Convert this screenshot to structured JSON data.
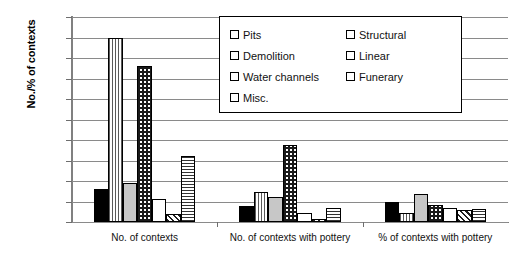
{
  "chart_data": {
    "type": "bar",
    "title": "",
    "xlabel": "",
    "ylabel": "No./% of contexts",
    "ylim": [
      0,
      500
    ],
    "ytick_step": 50,
    "yticks": [
      "500",
      "450",
      "400",
      "350",
      "300",
      "250",
      "200",
      "150",
      "100",
      "50",
      "0"
    ],
    "grid": true,
    "legend_position": "top-right-inset",
    "categories": [
      "No. of contexts",
      "No. of contexts with pottery",
      "% of contexts with pottery"
    ],
    "series": [
      {
        "name": "Pits",
        "pattern": "solid-black",
        "values": [
          80,
          40,
          48
        ]
      },
      {
        "name": "Structural",
        "pattern": "vertical-lines",
        "values": [
          450,
          72,
          22
        ]
      },
      {
        "name": "Demolition",
        "pattern": "solid-gray",
        "values": [
          95,
          62,
          68
        ]
      },
      {
        "name": "Linear",
        "pattern": "checkerboard",
        "values": [
          380,
          188,
          42
        ]
      },
      {
        "name": "Water channels",
        "pattern": "solid-white",
        "values": [
          55,
          22,
          35
        ]
      },
      {
        "name": "Funerary",
        "pattern": "diagonal-lines",
        "values": [
          20,
          8,
          30
        ]
      },
      {
        "name": "Misc.",
        "pattern": "horizontal-lines",
        "values": [
          162,
          35,
          32
        ]
      }
    ]
  },
  "legend": {
    "column_left": [
      "Pits",
      "Demolition",
      "Water channels",
      "Misc."
    ],
    "column_right": [
      "Structural",
      "Linear",
      "Funerary"
    ]
  },
  "colors": {
    "axis": "#808080",
    "gridline": "#8a8a8a",
    "bar_outline": "#000000",
    "pits_fill": "#000000",
    "demolition_fill": "#c7c7c7",
    "water_fill": "#ffffff",
    "background": "#ffffff"
  }
}
